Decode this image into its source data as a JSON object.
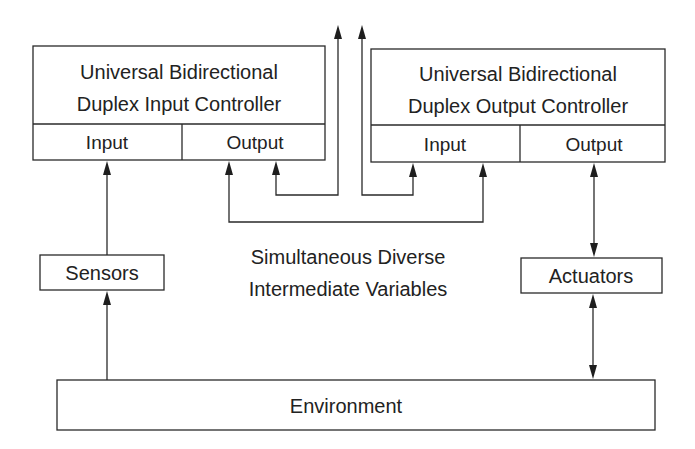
{
  "diagram": {
    "input_controller": {
      "title_line1": "Universal Bidirectional",
      "title_line2": "Duplex Input Controller",
      "port_input": "Input",
      "port_output": "Output"
    },
    "output_controller": {
      "title_line1": "Universal Bidirectional",
      "title_line2": "Duplex Output Controller",
      "port_input": "Input",
      "port_output": "Output"
    },
    "sensors": "Sensors",
    "actuators": "Actuators",
    "environment": "Environment",
    "intermediate_label_line1": "Simultaneous Diverse",
    "intermediate_label_line2": "Intermediate Variables",
    "colors": {
      "stroke": "#2a2a2a",
      "text": "#222222",
      "background": "#ffffff"
    }
  }
}
